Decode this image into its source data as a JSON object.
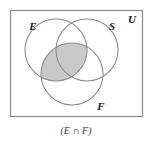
{
  "figure": {
    "type": "venn-diagram",
    "set_count": 3,
    "universe_label": "U",
    "caption": "(E ∩ F)",
    "colors": {
      "shade": "#c9c9c9",
      "stroke": "#8a8a8a",
      "rect_stroke": "#8a8a8a",
      "label_text": "#1a1a1a",
      "caption_text": "#3a3a3a",
      "background": "#ffffff"
    },
    "sets": [
      {
        "label": "E",
        "cx": 56,
        "cy": 50,
        "r": 31,
        "label_x": 33,
        "label_y": 30
      },
      {
        "label": "S",
        "cx": 87,
        "cy": 50,
        "r": 31,
        "label_x": 112,
        "label_y": 30
      },
      {
        "label": "F",
        "cx": 72,
        "cy": 74,
        "r": 31,
        "label_x": 101,
        "label_y": 110
      }
    ],
    "universe": {
      "x": 10.5,
      "y": 10.5,
      "width": 132,
      "height": 106,
      "label_x": 132,
      "label_y": 23
    },
    "shaded_description": "Intersection of set E and set F",
    "shaded_sets": [
      "E",
      "F"
    ],
    "caption_x": 76,
    "caption_y": 134
  }
}
